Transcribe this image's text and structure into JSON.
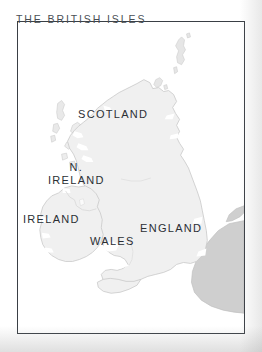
{
  "figure": {
    "kind": "map",
    "title": "THE BRITISH ISLES",
    "frame_border_color": "#3a3f45",
    "background_color": "#ffffff"
  },
  "map": {
    "sea_color": "#ffffff",
    "land_fill": "#f0f0f0",
    "land_stroke": "#c9c9c9",
    "continent_fill": "#cfcfcf",
    "continent_stroke": "#c0c0c0",
    "label_color": "#2b2f34",
    "title_color": "#4a4f55",
    "labels": [
      {
        "id": "scotland",
        "text": "SCOTLAND",
        "lines": [
          "SCOTLAND"
        ]
      },
      {
        "id": "n-ireland",
        "text": "N. IRELAND",
        "lines": [
          "N.",
          "IRELAND"
        ]
      },
      {
        "id": "ireland",
        "text": "IRELAND",
        "lines": [
          "IRELAND"
        ]
      },
      {
        "id": "wales",
        "text": "WALES",
        "lines": [
          "WALES"
        ]
      },
      {
        "id": "england",
        "text": "ENGLAND",
        "lines": [
          "ENGLAND"
        ]
      }
    ],
    "label_text": {
      "scotland": "SCOTLAND",
      "n_ireland_line1": "N.",
      "n_ireland_line2": "IRELAND",
      "ireland": "IRELAND",
      "wales": "WALES",
      "england": "ENGLAND"
    }
  }
}
